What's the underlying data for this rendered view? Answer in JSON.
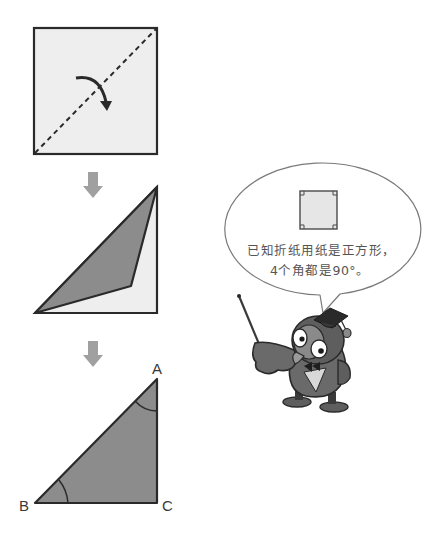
{
  "figure": {
    "colors": {
      "paper_light": "#eeeeee",
      "paper_folded": "#8c8c8c",
      "outline": "#2a2a2a",
      "step_arrow": "#a0a0a0",
      "owl_dark": "#5e5e5e",
      "owl_mid": "#7a7a7a",
      "owl_light": "#c8c8c8"
    },
    "steps": [
      {
        "name": "square-with-diagonal-fold-line",
        "action": "fold along dashed diagonal"
      },
      {
        "name": "partially-folded"
      },
      {
        "name": "right-triangle-abc"
      }
    ],
    "triangle_labels": {
      "a": "A",
      "b": "B",
      "c": "C"
    },
    "speech_bubble": {
      "line1": "已知折纸用纸是正方形，",
      "line2": "4个角都是90°。",
      "icon": "square-with-right-angle-marks"
    },
    "character": {
      "name": "owl-teacher",
      "props": [
        "graduation-cap",
        "pointer-stick",
        "bow-tie"
      ]
    }
  }
}
